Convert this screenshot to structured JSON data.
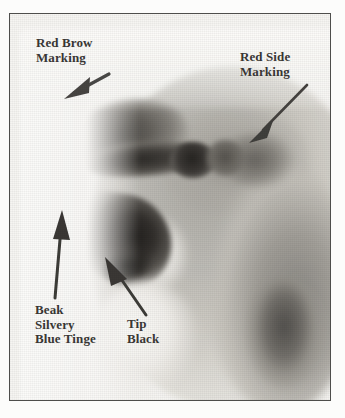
{
  "figure": {
    "kind": "annotated-photograph",
    "frame": {
      "border_color": "#4e4e4c",
      "background_color": "#f6f5f2"
    },
    "ink_color": "#3a3835"
  },
  "annotations": [
    {
      "id": "red-brow-marking",
      "label": "Red Brow\nMarking",
      "arrow": {
        "from": [
          98,
          62
        ],
        "to": [
          57,
          83
        ],
        "direction": "down-left"
      }
    },
    {
      "id": "red-side-marking",
      "label": "Red Side\nMarking",
      "arrow": {
        "from": [
          296,
          72
        ],
        "to": [
          240,
          126
        ],
        "direction": "down-left"
      }
    },
    {
      "id": "beak-silvery-blue-tinge",
      "label": "Beak\nSilvery\nBlue Tinge",
      "arrow": {
        "from": [
          44,
          283
        ],
        "to": [
          52,
          198
        ],
        "direction": "up"
      }
    },
    {
      "id": "tip-black",
      "label": "Tip\nBlack",
      "arrow": {
        "from": [
          135,
          300
        ],
        "to": [
          94,
          245
        ],
        "direction": "up-left"
      }
    }
  ]
}
